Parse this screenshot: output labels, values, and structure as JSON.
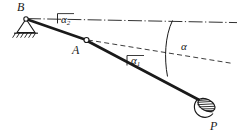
{
  "figure": {
    "type": "statics-diagram",
    "background_color": "#ffffff",
    "ink_color": "#1a1a1a"
  },
  "labels": {
    "support_point": "B",
    "joint_point": "A",
    "load_point": "P",
    "angle_lower": "α",
    "angle_lower_sub": "1",
    "angle_upper": "α",
    "angle_upper_sub": "2",
    "angle_total": "α"
  },
  "geometry": {
    "point_B": [
      26,
      18
    ],
    "point_A": [
      86,
      40
    ],
    "point_P": [
      205,
      103
    ],
    "datum_line_from_B": {
      "style": "dash-dot",
      "from": [
        26,
        18
      ],
      "to": [
        236,
        22
      ]
    },
    "datum_line_from_A": {
      "style": "dashed",
      "from": [
        86,
        40
      ],
      "to": [
        232,
        63
      ]
    },
    "member_BA": {
      "style": "solid-thick",
      "from": [
        26,
        18
      ],
      "to": [
        86,
        40
      ]
    },
    "member_AP": {
      "style": "solid-thick",
      "from": [
        86,
        40
      ],
      "to": [
        205,
        103
      ]
    },
    "angle_arc_alpha": {
      "from": [
        172,
        21
      ],
      "to": [
        168,
        75
      ],
      "label_at": [
        186,
        47
      ]
    },
    "angle_tick_alpha1": {
      "at": [
        128,
        57
      ]
    },
    "angle_tick_alpha2": {
      "at": [
        58,
        16
      ]
    }
  },
  "elements": {
    "pin_support": "hatched triangle ground support at B",
    "pin_joint": "small open circle hinge at A",
    "load_weight": "hatched ellipse weight hanging at P"
  }
}
